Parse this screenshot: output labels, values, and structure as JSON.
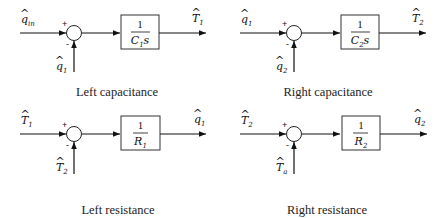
{
  "diagram": {
    "blocks": [
      {
        "id": "left-capacitance",
        "caption": "Left capacitance",
        "input_plus": {
          "sym": "q",
          "hat": "^",
          "sub": "in"
        },
        "input_minus": {
          "sym": "q",
          "hat": "^",
          "sub": "1"
        },
        "output": {
          "sym": "T",
          "hat": "^",
          "sub": "1"
        },
        "tf_num": "1",
        "tf_den": {
          "sym": "C",
          "sub": "1",
          "suffix": "s"
        },
        "plus_sign": "+",
        "minus_sign": "-"
      },
      {
        "id": "right-capacitance",
        "caption": "Right capacitance",
        "input_plus": {
          "sym": "q",
          "hat": "^",
          "sub": "1"
        },
        "input_minus": {
          "sym": "q",
          "hat": "^",
          "sub": "2"
        },
        "output": {
          "sym": "T",
          "hat": "^",
          "sub": "2"
        },
        "tf_num": "1",
        "tf_den": {
          "sym": "C",
          "sub": "2",
          "suffix": "s"
        },
        "plus_sign": "+",
        "minus_sign": "-"
      },
      {
        "id": "left-resistance",
        "caption": "Left resistance",
        "input_plus": {
          "sym": "T",
          "hat": "^",
          "sub": "1"
        },
        "input_minus": {
          "sym": "T",
          "hat": "^",
          "sub": "2"
        },
        "output": {
          "sym": "q",
          "hat": "^",
          "sub": "1"
        },
        "tf_num": "1",
        "tf_den": {
          "sym": "R",
          "sub": "1",
          "suffix": ""
        },
        "plus_sign": "+",
        "minus_sign": "-"
      },
      {
        "id": "right-resistance",
        "caption": "Right resistance",
        "input_plus": {
          "sym": "T",
          "hat": "^",
          "sub": "2"
        },
        "input_minus": {
          "sym": "T",
          "hat": "^",
          "sub": "a"
        },
        "output": {
          "sym": "q",
          "hat": "^",
          "sub": "2"
        },
        "tf_num": "1",
        "tf_den": {
          "sym": "R",
          "sub": "2",
          "suffix": ""
        },
        "plus_sign": "+",
        "minus_sign": "-"
      }
    ]
  },
  "colors": {
    "line": "#111111",
    "background": "#ffffff"
  }
}
